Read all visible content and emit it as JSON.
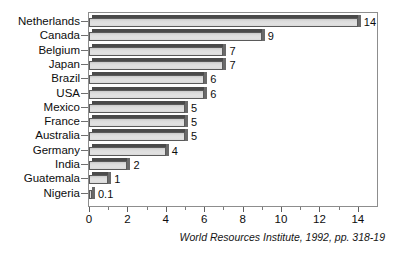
{
  "chart_data": {
    "type": "bar",
    "orientation": "horizontal",
    "title": "",
    "subtitle": "",
    "xlabel": "",
    "ylabel": "",
    "xlim": [
      0,
      15
    ],
    "ylim": null,
    "grid": false,
    "legend": null,
    "categories": [
      "Netherlands",
      "Canada",
      "Belgium",
      "Japan",
      "Brazil",
      "USA",
      "Mexico",
      "France",
      "Australia",
      "Germany",
      "India",
      "Guatemala",
      "Nigeria"
    ],
    "values": [
      14,
      9,
      7,
      7,
      6,
      6,
      5,
      5,
      5,
      4,
      2,
      1,
      0.1
    ],
    "value_labels": [
      "14",
      "9",
      "7",
      "7",
      "6",
      "6",
      "5",
      "5",
      "5",
      "4",
      "2",
      "1",
      "0.1"
    ],
    "x_ticks": [
      0,
      2,
      4,
      6,
      8,
      10,
      12,
      14
    ],
    "x_tick_labels": [
      "0",
      "2",
      "4",
      "6",
      "8",
      "10",
      "12",
      "14"
    ],
    "x_minor_ticks": [
      1,
      3,
      5,
      7,
      9,
      11,
      13
    ],
    "annotations": [
      "World Resources Institute, 1992, pp. 318-19"
    ],
    "colors": {
      "bar_face": "#d5d5d5",
      "bar_top": "#4a4a4a",
      "bar_side": "#6a6a6a",
      "bar_outline": "#5a5a5a",
      "frame": "#8d8d8d",
      "text": "#0d0d0d",
      "background": "#ffffff"
    }
  },
  "source_note": "World Resources Institute, 1992, pp. 318-19"
}
